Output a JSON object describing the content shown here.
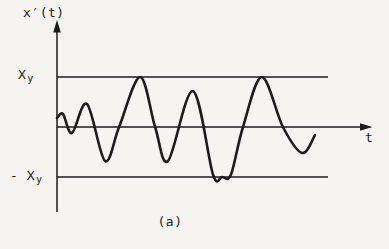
{
  "figure": {
    "background": "#f5f4f1",
    "ink": "#1c1c1c",
    "caption": "(a)"
  },
  "labels": {
    "y_axis": "x′(t)",
    "x_axis": "t",
    "upper_threshold_main": "X",
    "upper_threshold_sub": "y",
    "lower_threshold_main": "- X",
    "lower_threshold_sub": "y"
  },
  "chart_data": {
    "type": "line",
    "title": "",
    "xlabel": "t",
    "ylabel": "x′(t)",
    "caption": "(a)",
    "legend": false,
    "grid": false,
    "x_axis_numeric_ticks": false,
    "ylim": [
      -1.5,
      1.5
    ],
    "thresholds": [
      {
        "label": "Xy",
        "value": 1.0
      },
      {
        "label": "-Xy",
        "value": -1.0
      }
    ],
    "series": [
      {
        "name": "x′(t)",
        "t": [
          0.0,
          0.2,
          0.5,
          1.0,
          1.6,
          2.07,
          2.77,
          3.27,
          3.7,
          4.53,
          5.2,
          5.5,
          5.8,
          6.2,
          6.83,
          7.53,
          8.17,
          8.6
        ],
        "amplitude": [
          0.18,
          0.26,
          -0.12,
          0.46,
          -0.68,
          0.0,
          1.0,
          0.0,
          -0.68,
          0.72,
          -0.95,
          -1.0,
          -0.95,
          0.0,
          1.0,
          0.0,
          -0.52,
          -0.16
        ]
      }
    ]
  }
}
